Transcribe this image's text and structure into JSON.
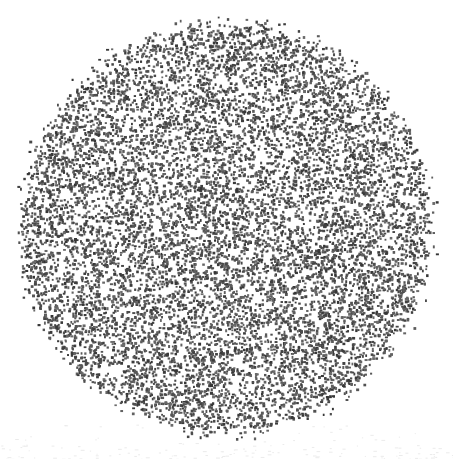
{
  "figure": {
    "kind": "random-dot-stipple-field",
    "description": "A dense field of randomly scattered small dark dots filling a single large circle on a plain white background. No axes, labels, legend or text are present.",
    "canvas": {
      "width": 453,
      "height": 459,
      "background_color": "#ffffff"
    },
    "shape": {
      "type": "circle",
      "center_x": 226,
      "center_y": 228,
      "radius": 214,
      "bounds": {
        "left": 12,
        "top": 10,
        "right": 440,
        "bottom": 446
      },
      "edge_style": "soft-feathered",
      "edge_feather_width": 14
    },
    "stipple": {
      "dot_count": 11000,
      "dot_min_size": 1.7,
      "dot_max_size": 3.1,
      "dot_color_dark": "#343434",
      "dot_color_light": "#6e6e6e",
      "coverage_percent": 48,
      "distribution": "uniform-random",
      "random_seed": 20240513
    },
    "artifacts": {
      "present": true,
      "color": "#ebebeb",
      "note": "faint light-gray scanner speckle in lower margin",
      "count": 160
    }
  }
}
